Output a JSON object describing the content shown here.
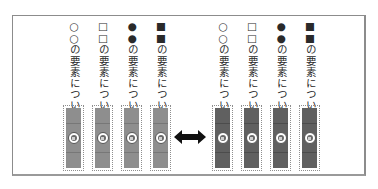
{
  "diagram": {
    "left_group": {
      "variant": "light",
      "fill_color": "#8e8e8e",
      "items": [
        {
          "label": "○○の要素については、"
        },
        {
          "label": "□□の要素については、"
        },
        {
          "label": "●●の要素については、"
        },
        {
          "label": "■■の要素については、"
        }
      ]
    },
    "connector": {
      "icon": "double-headed-arrow-icon",
      "color": "#111111"
    },
    "right_group": {
      "variant": "dark",
      "fill_color": "#606060",
      "items": [
        {
          "label": "○○の要素については、"
        },
        {
          "label": "□□の要素については、"
        },
        {
          "label": "●●の要素については、"
        },
        {
          "label": "■■の要素については、"
        }
      ]
    }
  }
}
